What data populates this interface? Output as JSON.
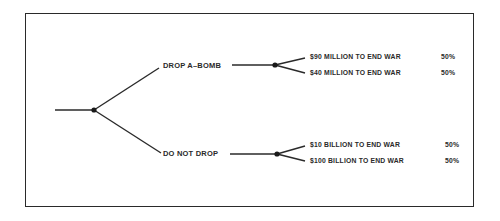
{
  "diagram": {
    "type": "decision-tree",
    "root": {
      "id": "decision"
    },
    "branches": [
      {
        "label": "DROP A–BOMB",
        "outcomes": [
          {
            "label": "$90 MILLION TO END WAR",
            "probability": "50%"
          },
          {
            "label": "$40 MILLION TO END WAR",
            "probability": "50%"
          }
        ]
      },
      {
        "label": "DO NOT DROP",
        "outcomes": [
          {
            "label": "$10 BILLION TO END WAR",
            "probability": "50%"
          },
          {
            "label": "$100 BILLION TO END WAR",
            "probability": "50%"
          }
        ]
      }
    ],
    "colors": {
      "line": "#2a2a2a",
      "background": "#ffffff"
    }
  }
}
